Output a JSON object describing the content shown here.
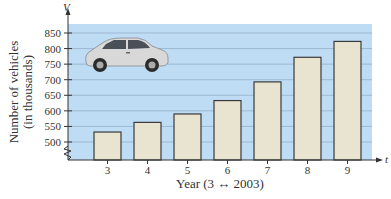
{
  "chart_data": {
    "type": "bar",
    "title": "",
    "xlabel": "Year (3 ↔ 2003)",
    "ylabel": "Number of vehicles (in thousands)",
    "ylabel_line1": "Number of vehicles",
    "ylabel_line2": "(in thousands)",
    "x_axis_var": "t",
    "y_axis_var": "V",
    "categories": [
      "3",
      "4",
      "5",
      "6",
      "7",
      "8",
      "9"
    ],
    "values": [
      532,
      563,
      590,
      633,
      693,
      772,
      823
    ],
    "yticks": [
      500,
      550,
      600,
      650,
      700,
      750,
      800,
      850
    ],
    "ylim": [
      460,
      880
    ],
    "y_axis_break": true,
    "grid": true,
    "legend": null,
    "annotations": [
      "car illustration in upper-left of plot area"
    ]
  },
  "colors": {
    "plot_background": "#bfdcf5",
    "gridline": "#8fa9c4",
    "bar_fill": "#e8e4cf",
    "bar_stroke": "#3a3a3a",
    "axis": "#333333"
  }
}
